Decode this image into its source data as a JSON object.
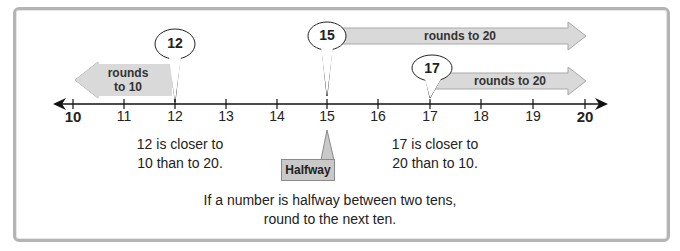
{
  "diagram": {
    "number_line": {
      "ticks": [
        {
          "value": "10",
          "bold": true
        },
        {
          "value": "11",
          "bold": false
        },
        {
          "value": "12",
          "bold": false
        },
        {
          "value": "13",
          "bold": false
        },
        {
          "value": "14",
          "bold": false
        },
        {
          "value": "15",
          "bold": false
        },
        {
          "value": "16",
          "bold": false
        },
        {
          "value": "17",
          "bold": false
        },
        {
          "value": "18",
          "bold": false
        },
        {
          "value": "19",
          "bold": false
        },
        {
          "value": "20",
          "bold": true
        }
      ]
    },
    "callouts": [
      {
        "number": "12",
        "arrow_label_line1": "rounds",
        "arrow_label_line2": "to 10",
        "direction": "left"
      },
      {
        "number": "15",
        "arrow_label": "rounds to 20",
        "direction": "right"
      },
      {
        "number": "17",
        "arrow_label": "rounds to 20",
        "direction": "right"
      }
    ],
    "notes": {
      "left_line1": "12 is closer to",
      "left_line2": "10 than to 20.",
      "right_line1": "17 is closer to",
      "right_line2": "20 than to 10.",
      "halfway_label": "Halfway",
      "rule_line1": "If a number is halfway between two tens,",
      "rule_line2": "round to the next ten."
    },
    "colors": {
      "arrow_fill": "#d9d9d9",
      "arrow_stroke": "#a8a8a8",
      "frame_border": "#b4b4b4",
      "line": "#111111"
    }
  }
}
